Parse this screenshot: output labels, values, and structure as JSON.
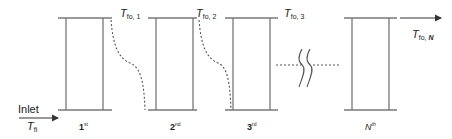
{
  "diagram": {
    "type": "multistage-series-flow",
    "line_color": "#777777",
    "dash_color": "#555555",
    "inlet": {
      "label": "Inlet",
      "temperature_symbol": "T",
      "temperature_sub": "fi"
    },
    "outlet": {
      "temperature_symbol": "T",
      "temperature_sub_prefix": "fo, ",
      "temperature_sub_index": "N"
    },
    "stages": [
      {
        "name": "1",
        "suffix": "st",
        "outlet_symbol": "T",
        "outlet_sub": "fo, 1"
      },
      {
        "name": "2",
        "suffix": "nd",
        "outlet_symbol": "T",
        "outlet_sub": "fo, 2"
      },
      {
        "name": "3",
        "suffix": "rd",
        "outlet_symbol": "T",
        "outlet_sub": "fo, 3"
      },
      {
        "name": "N",
        "suffix": "th"
      }
    ]
  }
}
